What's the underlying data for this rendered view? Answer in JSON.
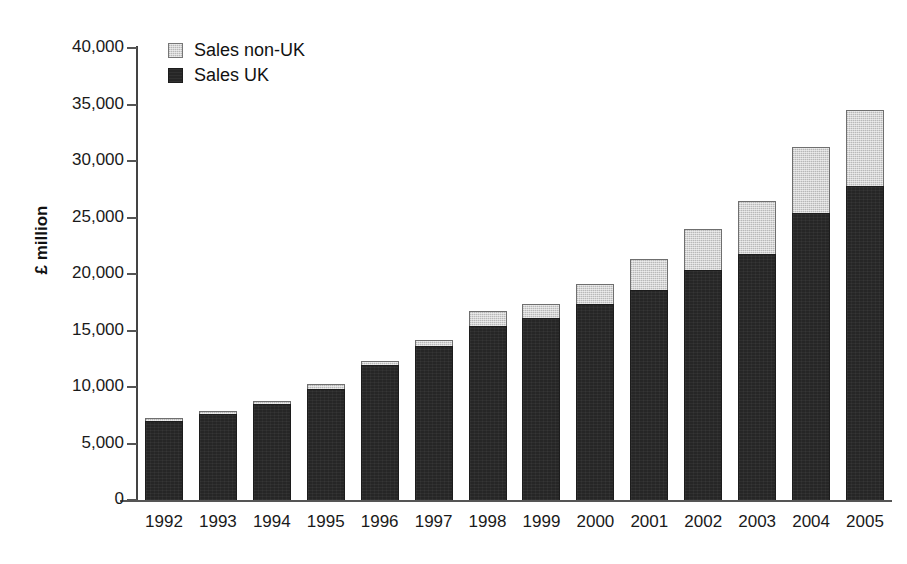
{
  "chart_data": {
    "type": "bar",
    "subtype": "stacked-bar",
    "title": "",
    "xlabel": "",
    "ylabel": "£ million",
    "ylim": [
      0,
      40000
    ],
    "ytick_step": 5000,
    "ytick_labels": [
      "40,000",
      "35,000",
      "30,000",
      "25,000",
      "20,000",
      "15,000",
      "10,000",
      "5,000",
      "0"
    ],
    "ytick_values": [
      40000,
      35000,
      30000,
      25000,
      20000,
      15000,
      10000,
      5000,
      0
    ],
    "grid": false,
    "legend_position": "top-left",
    "categories": [
      "1992",
      "1993",
      "1994",
      "1995",
      "1996",
      "1997",
      "1998",
      "1999",
      "2000",
      "2001",
      "2002",
      "2003",
      "2004",
      "2005"
    ],
    "series": [
      {
        "name": "Sales UK",
        "color": "#262626",
        "values": [
          6950,
          7600,
          8500,
          9850,
          11950,
          13600,
          15400,
          16150,
          17350,
          18600,
          20350,
          21800,
          25400,
          27800
        ]
      },
      {
        "name": "Sales non-UK",
        "color": "#d4d4d4",
        "values": [
          100,
          100,
          200,
          400,
          350,
          550,
          1300,
          1200,
          1750,
          2750,
          3650,
          4650,
          5800,
          6750
        ]
      }
    ],
    "totals": [
      7050,
      7700,
      8700,
      10250,
      12300,
      14150,
      16700,
      17350,
      19100,
      21350,
      24000,
      26450,
      31200,
      34550
    ]
  },
  "legend": {
    "items": [
      {
        "label": "Sales non-UK",
        "swatch": "nonuk"
      },
      {
        "label": "Sales UK",
        "swatch": "uk"
      }
    ]
  }
}
